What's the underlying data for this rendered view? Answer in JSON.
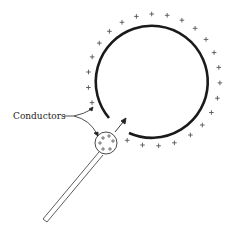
{
  "diagram": {
    "label": "Conductors",
    "charge_symbol": "+",
    "colors": {
      "stroke": "#1a1a1a",
      "charge": "#555555",
      "background": "#ffffff"
    }
  }
}
